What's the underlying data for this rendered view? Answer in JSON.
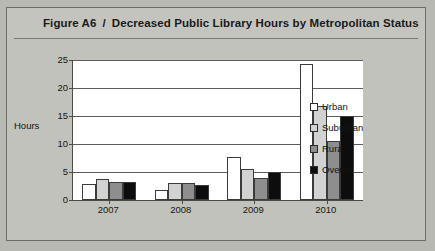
{
  "figure": {
    "label": "Figure A6",
    "separator": "/",
    "title": "Decreased Public Library Hours by Metropolitan Status"
  },
  "chart_data": {
    "type": "bar",
    "title": "Decreased Public Library Hours by Metropolitan Status",
    "xlabel": "",
    "ylabel": "Hours",
    "ylim": [
      0,
      25
    ],
    "yticks": [
      0,
      5,
      10,
      15,
      20,
      25
    ],
    "ytick_labels": [
      "0",
      "5",
      "10",
      "15",
      "20",
      "25"
    ],
    "grid": true,
    "legend_position": "right",
    "categories": [
      "2007",
      "2008",
      "2009",
      "2010"
    ],
    "series": [
      {
        "name": "Urban",
        "color": "#ffffff",
        "values": [
          2.8,
          1.7,
          7.7,
          24.3
        ]
      },
      {
        "name": "Suburban",
        "color": "#d2d2d2",
        "values": [
          3.8,
          3.0,
          5.5,
          16.7
        ]
      },
      {
        "name": "Rural",
        "color": "#8e8e8e",
        "values": [
          3.3,
          3.0,
          4.0,
          10.5
        ]
      },
      {
        "name": "Overall",
        "color": "#0d0d0d",
        "values": [
          3.3,
          2.7,
          5.0,
          15.0
        ]
      }
    ]
  }
}
